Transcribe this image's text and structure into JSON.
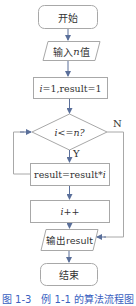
{
  "diagram": {
    "type": "flowchart",
    "colors": {
      "border": "#a8a8a8",
      "arrow": "#5a6f9a",
      "text": "#333333",
      "caption": "#3a5fbf"
    },
    "nodes": [
      {
        "id": "start",
        "shape": "rounded-rect",
        "text": "开始"
      },
      {
        "id": "input",
        "shape": "parallelogram",
        "text_prefix": "输入",
        "text_var": "n",
        "text_suffix": "值"
      },
      {
        "id": "init",
        "shape": "rect",
        "text_var": "i",
        "text_suffix": "=1,result=1"
      },
      {
        "id": "cond",
        "shape": "diamond",
        "text_var1": "i",
        "text_mid": "<=",
        "text_var2": "n",
        "text_suffix": "?"
      },
      {
        "id": "mult",
        "shape": "rect",
        "text_prefix": "result=result*",
        "text_var": "i"
      },
      {
        "id": "incr",
        "shape": "rect",
        "text_var": "i",
        "text_suffix": "++"
      },
      {
        "id": "output",
        "shape": "parallelogram",
        "text": "输出result"
      },
      {
        "id": "end",
        "shape": "rounded-rect",
        "text": "结束"
      }
    ],
    "edges": [
      {
        "from": "start",
        "to": "input"
      },
      {
        "from": "input",
        "to": "init"
      },
      {
        "from": "init",
        "to": "cond"
      },
      {
        "from": "cond",
        "to": "mult",
        "label": "Y"
      },
      {
        "from": "mult",
        "to": "incr"
      },
      {
        "from": "mult",
        "to": "cond",
        "note": "loop back on left"
      },
      {
        "from": "cond",
        "to": "output",
        "label": "N"
      },
      {
        "from": "output",
        "to": "end"
      }
    ],
    "labels": {
      "yes": "Y",
      "no": "N"
    }
  },
  "caption": "图 1-3　例 1-1 的算法流程图"
}
